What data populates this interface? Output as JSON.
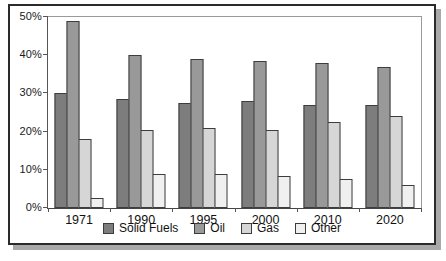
{
  "chart_data": {
    "type": "bar",
    "title": "",
    "xlabel": "",
    "ylabel": "",
    "categories": [
      "1971",
      "1990",
      "1995",
      "2000",
      "2010",
      "2020"
    ],
    "series": [
      {
        "name": "Solid Fuels",
        "color": "#7d7d7d",
        "values": [
          30,
          28.5,
          27.5,
          28,
          27,
          27
        ]
      },
      {
        "name": "Oil",
        "color": "#999999",
        "values": [
          49,
          40,
          39,
          38.5,
          38,
          37
        ]
      },
      {
        "name": "Gas",
        "color": "#d6d6d6",
        "values": [
          18,
          20.5,
          21,
          20.5,
          22.5,
          24
        ]
      },
      {
        "name": "Other",
        "color": "#f0f0f0",
        "values": [
          2.5,
          9,
          9,
          8.5,
          7.5,
          6
        ]
      }
    ],
    "ylim": [
      0,
      50
    ],
    "yticks": [
      {
        "value": 0,
        "label": "0%"
      },
      {
        "value": 10,
        "label": "10%"
      },
      {
        "value": 20,
        "label": "20%"
      },
      {
        "value": 30,
        "label": "30%"
      },
      {
        "value": 40,
        "label": "40%"
      },
      {
        "value": 50,
        "label": "50%"
      }
    ],
    "grid": false,
    "legend_position": "bottom",
    "frame_border_color": "#2b2b2b",
    "shadow_color": "#a9a9a9"
  }
}
